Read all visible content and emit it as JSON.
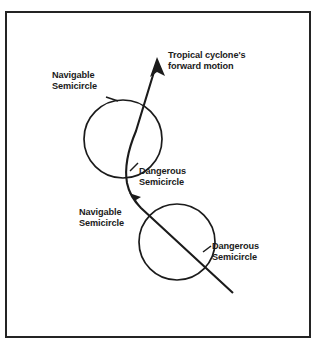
{
  "figure": {
    "frame": {
      "border_color": "#242424",
      "background_color": "#ffffff",
      "border_width_px": 2
    },
    "ink_color": "#1b1b1b",
    "labels": {
      "cyclone_motion_line1": "Tropical cyclone's",
      "cyclone_motion_line2": "forward motion",
      "navigable_upper_line1": "Navigable",
      "navigable_upper_line2": "Semicircle",
      "dangerous_upper_line1": "Dangerous",
      "dangerous_upper_line2": "Semicircle",
      "navigable_lower_line1": "Navigable",
      "navigable_lower_line2": "Semicircle",
      "dangerous_lower_line1": "Dangerous",
      "dangerous_lower_line2": "Semicircle"
    },
    "shapes": {
      "upper_storm_circle": {
        "cx": 123,
        "cy": 139,
        "r": 39
      },
      "lower_storm_circle": {
        "cx": 177,
        "cy": 242,
        "r": 38
      },
      "track_start": {
        "x": 233,
        "y": 293
      },
      "track_end": {
        "x": 157,
        "y": 58
      },
      "mid_arrow_tip": {
        "x": 130,
        "y": 194
      }
    }
  }
}
